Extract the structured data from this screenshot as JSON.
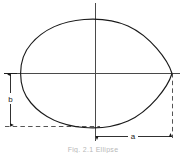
{
  "figure": {
    "name": "ovoid-cross-section-diagram",
    "background_color": "#ffffff",
    "curve_color": "#1a1a1a",
    "axis_color": "#4a4a4a",
    "dimension_color": "#1a1a1a",
    "dashed_color": "#555555",
    "caption_color": "#b8b8b8"
  },
  "labels": {
    "semi_major": "a",
    "semi_minor": "b"
  },
  "caption": {
    "text": "Fig.  2.1  Ellipse"
  },
  "geometry": {
    "origin_x": 95,
    "origin_y": 73,
    "leftmost_x": 21,
    "rightmost_x": 172,
    "top_y": 19,
    "bottom_y": 126,
    "semi_major_px": 77,
    "semi_minor_px": 53,
    "vertical_axis_top_y": 3,
    "vertical_axis_bottom_y": 141,
    "horizontal_axis_left_x": 4,
    "horizontal_axis_right_x": 180,
    "b_dimension_x": 10,
    "a_dimension_y": 136,
    "shape_description": "egg-shaped ovoid, rounded at left, tapering to a point at right"
  }
}
